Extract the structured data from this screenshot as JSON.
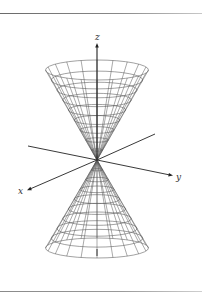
{
  "figure": {
    "axes": {
      "x_label": "x",
      "y_label": "y",
      "z_label": "z"
    },
    "colors": {
      "mesh": "#555555",
      "axis": "#222222",
      "rule": "#777777"
    },
    "mesh": {
      "rings_per_nappe": 9,
      "generators": 20
    }
  }
}
